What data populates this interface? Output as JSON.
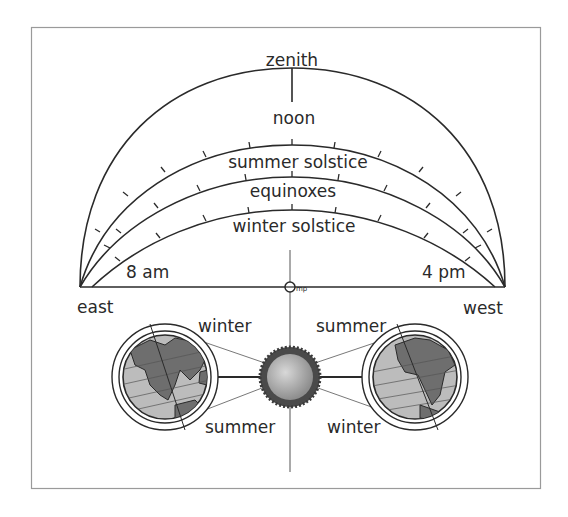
{
  "diagram": {
    "colors": {
      "line": "#2a2a2a",
      "frame": "#9a9a9a",
      "sun_fill": "#b0b0b0",
      "sun_corona": "#4a4a4a",
      "earth_land": "#6e6e6e",
      "earth_ocean": "#c8c8c8"
    },
    "sky": {
      "zenith_label": "zenith",
      "noon_label": "noon",
      "paths": [
        {
          "id": "summer",
          "label": "summer solstice"
        },
        {
          "id": "equinox",
          "label": "equinoxes"
        },
        {
          "id": "winter",
          "label": "winter solstice"
        }
      ],
      "time_left": "8 am",
      "time_right": "4 pm",
      "direction_left": "east",
      "direction_right": "west",
      "observer_label": "mp"
    },
    "orbit": {
      "left_earth": {
        "top_label": "winter",
        "bottom_label": "summer"
      },
      "right_earth": {
        "top_label": "summer",
        "bottom_label": "winter"
      },
      "sun_label": "sun"
    }
  }
}
